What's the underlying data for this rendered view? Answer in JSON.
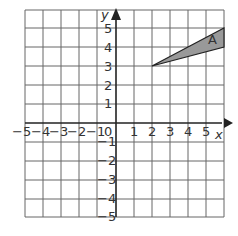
{
  "graph": {
    "x_axis_label": "x",
    "y_axis_label": "y",
    "x_range": [
      -5,
      5
    ],
    "y_range": [
      -5,
      5
    ],
    "x_ticks": [
      "−5",
      "−4",
      "−3",
      "−2",
      "−1",
      "0",
      "1",
      "2",
      "3",
      "4",
      "5"
    ],
    "y_ticks": [
      "5",
      "4",
      "3",
      "2",
      "1",
      "−1",
      "−2",
      "−3",
      "−4",
      "−5"
    ],
    "shape": {
      "label": "A",
      "vertices": [
        [
          2,
          3
        ],
        [
          5,
          5
        ],
        [
          5,
          4
        ]
      ],
      "fill": "#999999",
      "stroke": "#222222"
    },
    "colors": {
      "grid": "#555555",
      "axis": "#222222"
    }
  }
}
